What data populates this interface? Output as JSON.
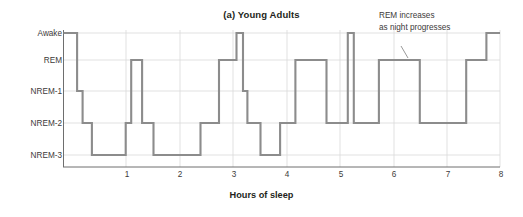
{
  "chart_data": {
    "type": "line",
    "title": "(a) Young Adults",
    "xlabel": "Hours of sleep",
    "ylabel": "",
    "xlim": [
      0,
      8
    ],
    "xticks": [
      1,
      2,
      3,
      4,
      5,
      6,
      7,
      8
    ],
    "xtick_labels": [
      "1",
      "2",
      "3",
      "4",
      "5",
      "6",
      "7",
      "8"
    ],
    "ycategories": [
      "Awake",
      "REM",
      "NREM-1",
      "NREM-2",
      "NREM-3"
    ],
    "grid": true,
    "legend": null,
    "annotations": [
      {
        "text_line1": "REM increases",
        "text_line2": "as night progresses",
        "points_to_hours": 6.05,
        "points_to_stage": "REM"
      }
    ],
    "series": [
      {
        "name": "Sleep stage",
        "step": "post",
        "stages": [
          {
            "start": 0.0,
            "end": 0.25,
            "stage": "Awake"
          },
          {
            "start": 0.25,
            "end": 0.35,
            "stage": "NREM-1"
          },
          {
            "start": 0.35,
            "end": 0.52,
            "stage": "NREM-2"
          },
          {
            "start": 0.52,
            "end": 1.14,
            "stage": "NREM-3"
          },
          {
            "start": 1.14,
            "end": 1.24,
            "stage": "NREM-2"
          },
          {
            "start": 1.24,
            "end": 1.44,
            "stage": "REM"
          },
          {
            "start": 1.44,
            "end": 1.65,
            "stage": "NREM-2"
          },
          {
            "start": 1.65,
            "end": 2.51,
            "stage": "NREM-3"
          },
          {
            "start": 2.51,
            "end": 2.85,
            "stage": "NREM-2"
          },
          {
            "start": 2.85,
            "end": 3.17,
            "stage": "REM"
          },
          {
            "start": 3.17,
            "end": 3.29,
            "stage": "Awake"
          },
          {
            "start": 3.29,
            "end": 3.37,
            "stage": "NREM-1"
          },
          {
            "start": 3.37,
            "end": 3.61,
            "stage": "NREM-2"
          },
          {
            "start": 3.61,
            "end": 3.97,
            "stage": "NREM-3"
          },
          {
            "start": 3.97,
            "end": 4.25,
            "stage": "NREM-2"
          },
          {
            "start": 4.25,
            "end": 4.82,
            "stage": "REM"
          },
          {
            "start": 4.82,
            "end": 5.21,
            "stage": "NREM-2"
          },
          {
            "start": 5.21,
            "end": 5.32,
            "stage": "Awake"
          },
          {
            "start": 5.32,
            "end": 5.78,
            "stage": "NREM-2"
          },
          {
            "start": 5.78,
            "end": 6.53,
            "stage": "REM"
          },
          {
            "start": 6.53,
            "end": 7.38,
            "stage": "NREM-2"
          },
          {
            "start": 7.38,
            "end": 7.75,
            "stage": "REM"
          },
          {
            "start": 7.75,
            "end": 8.0,
            "stage": "Awake"
          }
        ]
      }
    ]
  }
}
